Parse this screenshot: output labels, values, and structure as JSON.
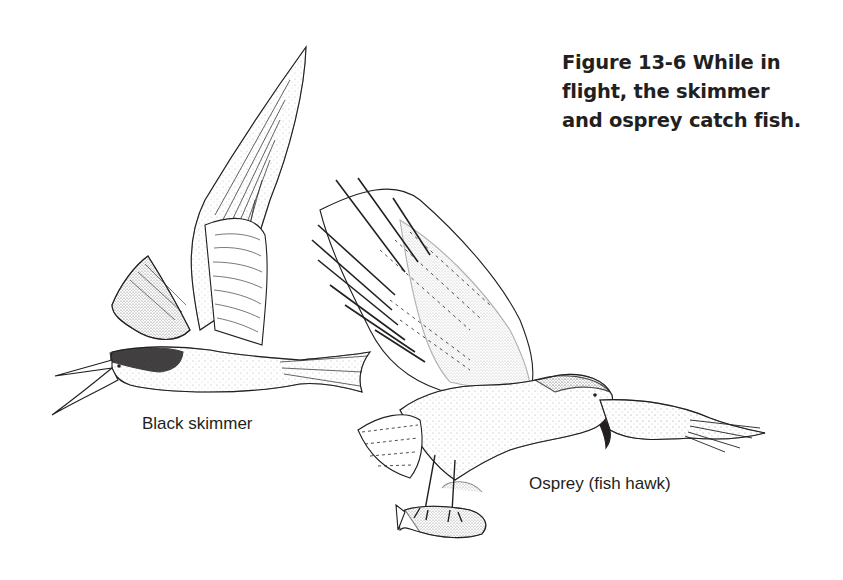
{
  "figure": {
    "caption_lines": [
      "Figure 13-6  While in",
      "flight, the skimmer",
      "and osprey catch fish."
    ],
    "labels": {
      "skimmer": "Black skimmer",
      "osprey": "Osprey (fish hawk)"
    },
    "illustrations": [
      {
        "name": "black-skimmer-illustration",
        "description": "Black skimmer in flight with lower bill open"
      },
      {
        "name": "osprey-illustration",
        "description": "Osprey in flight carrying a fish in its talons"
      }
    ],
    "colors": {
      "ink": "#231f20",
      "background": "#ffffff"
    }
  }
}
